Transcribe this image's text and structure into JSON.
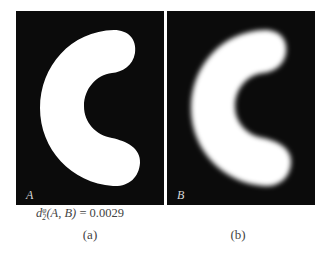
{
  "figure": {
    "panels": [
      {
        "id": "a",
        "label": "A",
        "description": "binary C-shaped region (sharp edges)"
      },
      {
        "id": "b",
        "label": "B",
        "description": "blurred C-shaped region"
      }
    ],
    "formula": {
      "symbol": "d",
      "superscript": "φ",
      "subscript": "2",
      "args": "(A, B)",
      "equals": "=",
      "value": "0.0029"
    },
    "subcaptions": [
      "(a)",
      "(b)"
    ],
    "colors": {
      "background": "#0b0b0b",
      "shape": "#ffffff"
    }
  }
}
